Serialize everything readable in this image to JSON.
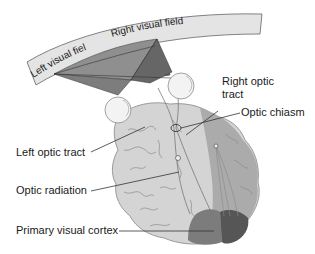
{
  "visual_field": {
    "left_label": "Left visual field",
    "right_label": "Right visual field"
  },
  "labels": {
    "right_optic_tract_line1": "Right optic",
    "right_optic_tract_line2": "tract",
    "optic_chiasm": "Optic chiasm",
    "left_optic_tract": "Left optic tract",
    "optic_radiation": "Optic radiation",
    "primary_visual_cortex": "Primary visual cortex"
  },
  "colors": {
    "band_fill": "#e4e4e4",
    "band_stroke": "#666666",
    "left_field_fill": "#8a8a8a",
    "right_field_fill": "#6c6c6c",
    "brain_fill": "#d2d2d2",
    "brain_fold_stroke": "#9a9a9a",
    "right_hemisphere_fill": "#a8a8a8",
    "cortex_light": "#7a7a7a",
    "cortex_dark": "#555555",
    "eye_fill": "#f2f2f2",
    "leader_line": "#333333",
    "text": "#1a1a1a"
  }
}
